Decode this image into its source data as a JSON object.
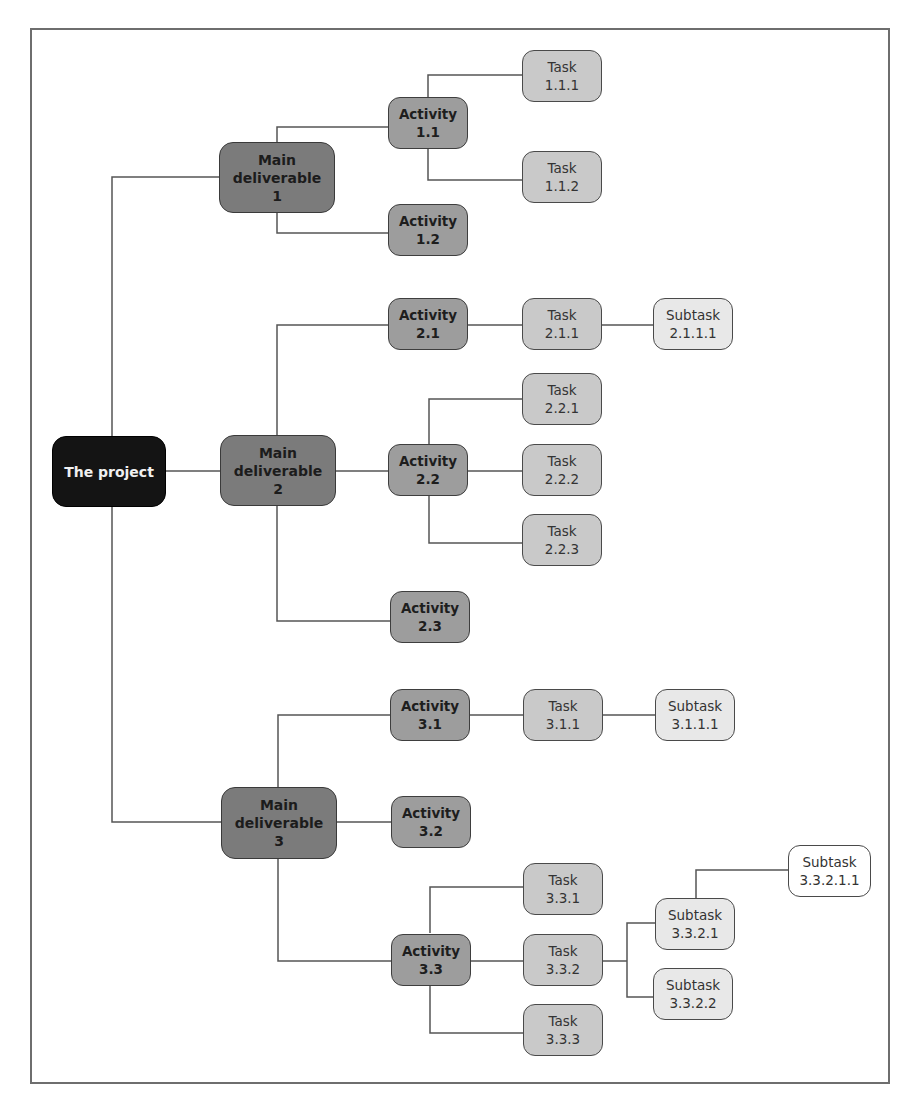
{
  "diagram": {
    "type": "work breakdown structure",
    "line_color": "#555555",
    "colors": {
      "project": "#141414",
      "main_deliverable": "#7b7b7b",
      "activity": "#9d9d9d",
      "task": "#c9c9c9",
      "subtask": "#e8e8e8",
      "sub_subtask": "#ffffff"
    },
    "nodes": {
      "project": {
        "l1": "The project",
        "l2": ""
      },
      "md1": {
        "l1": "Main",
        "l2": "deliverable",
        "l3": "1"
      },
      "md2": {
        "l1": "Main",
        "l2": "deliverable",
        "l3": "2"
      },
      "md3": {
        "l1": "Main",
        "l2": "deliverable",
        "l3": "3"
      },
      "a11": {
        "l1": "Activity",
        "l2": "1.1"
      },
      "a12": {
        "l1": "Activity",
        "l2": "1.2"
      },
      "a21": {
        "l1": "Activity",
        "l2": "2.1"
      },
      "a22": {
        "l1": "Activity",
        "l2": "2.2"
      },
      "a23": {
        "l1": "Activity",
        "l2": "2.3"
      },
      "a31": {
        "l1": "Activity",
        "l2": "3.1"
      },
      "a32": {
        "l1": "Activity",
        "l2": "3.2"
      },
      "a33": {
        "l1": "Activity",
        "l2": "3.3"
      },
      "t111": {
        "l1": "Task",
        "l2": "1.1.1"
      },
      "t112": {
        "l1": "Task",
        "l2": "1.1.2"
      },
      "t211": {
        "l1": "Task",
        "l2": "2.1.1"
      },
      "t221": {
        "l1": "Task",
        "l2": "2.2.1"
      },
      "t222": {
        "l1": "Task",
        "l2": "2.2.2"
      },
      "t223": {
        "l1": "Task",
        "l2": "2.2.3"
      },
      "t311": {
        "l1": "Task",
        "l2": "3.1.1"
      },
      "t331": {
        "l1": "Task",
        "l2": "3.3.1"
      },
      "t332": {
        "l1": "Task",
        "l2": "3.3.2"
      },
      "t333": {
        "l1": "Task",
        "l2": "3.3.3"
      },
      "s2111": {
        "l1": "Subtask",
        "l2": "2.1.1.1"
      },
      "s3111": {
        "l1": "Subtask",
        "l2": "3.1.1.1"
      },
      "s3321": {
        "l1": "Subtask",
        "l2": "3.3.2.1"
      },
      "s3322": {
        "l1": "Subtask",
        "l2": "3.3.2.2"
      },
      "s33211": {
        "l1": "Subtask",
        "l2": "3.3.2.1.1"
      }
    }
  }
}
